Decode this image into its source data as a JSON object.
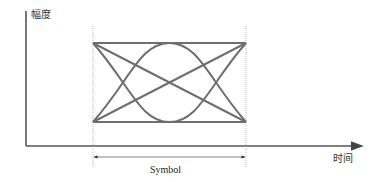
{
  "diagram": {
    "type": "eye-diagram",
    "y_axis_label": "幅度",
    "x_axis_label": "时间",
    "span_label": "Symbol",
    "colors": {
      "trace": "#6e6e6e",
      "axis": "#555555",
      "guide": "#bbbbbb"
    },
    "elements": [
      "top-horizontal-trace",
      "bottom-horizontal-trace",
      "falling-diagonal-trace",
      "rising-diagonal-trace",
      "upper-arc-trace",
      "lower-arc-trace",
      "left-symbol-boundary",
      "right-symbol-boundary",
      "symbol-span-arrow"
    ]
  }
}
